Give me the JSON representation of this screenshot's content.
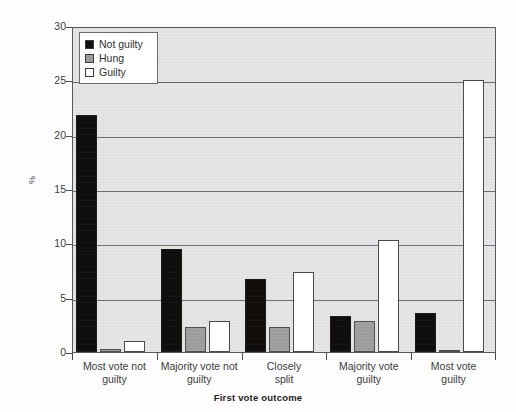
{
  "chart_data": {
    "type": "bar",
    "title": "",
    "subtitle": "",
    "xlabel": "First vote outcome",
    "ylabel": "%",
    "ylim": [
      0,
      30
    ],
    "yticks": [
      0,
      5,
      10,
      15,
      20,
      25,
      30
    ],
    "ytick_labels": [
      "0",
      "5",
      "10",
      "15",
      "20",
      "25",
      "30"
    ],
    "grid": true,
    "legend_position": "top-left",
    "categories": [
      "Most vote not guilty",
      "Majority vote not guilty",
      "Closely split",
      "Majority vote guilty",
      "Most vote guilty"
    ],
    "category_lines": [
      [
        "Most vote not",
        "guilty"
      ],
      [
        "Majority vote not",
        "guilty"
      ],
      [
        "Closely",
        "split"
      ],
      [
        "Majority vote",
        "guilty"
      ],
      [
        "Most vote",
        "guilty"
      ]
    ],
    "series": [
      {
        "name": "Not guilty",
        "color": "#111111",
        "values": [
          21.8,
          9.5,
          6.7,
          3.3,
          3.6
        ]
      },
      {
        "name": "Hung",
        "color": "#9b9b9b",
        "values": [
          0.3,
          2.3,
          2.3,
          2.9,
          0.2
        ]
      },
      {
        "name": "Guilty",
        "color": "#ffffff",
        "values": [
          1.0,
          2.9,
          7.4,
          10.3,
          25.0
        ]
      }
    ]
  },
  "legend": {
    "items": [
      {
        "label": "Not guilty",
        "swatch": "notguilty"
      },
      {
        "label": "Hung",
        "swatch": "hung"
      },
      {
        "label": "Guilty",
        "swatch": "guilty"
      }
    ]
  },
  "axes": {
    "y_title": "%",
    "x_title": "First vote outcome"
  }
}
